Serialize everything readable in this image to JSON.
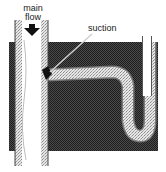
{
  "diagram": {
    "labels": {
      "main_line1": "main",
      "main_line2": "flow",
      "suction": "suction"
    },
    "colors": {
      "background": "#ffffff",
      "ground": "#3a3a3a",
      "pipe_interior": "#ffffff",
      "pipe_wall": "#9a9a9a",
      "branch_fill": "#d8d8d8",
      "ink": "#1a1a1a"
    },
    "elements": [
      {
        "name": "main-pipe",
        "description": "vertical pipe carrying main flow downward"
      },
      {
        "name": "flow-arrow",
        "description": "down arrow indicating direction of main flow"
      },
      {
        "name": "branch-pipe",
        "description": "horizontal branch pipe leaving main pipe, bending down into U-trap"
      },
      {
        "name": "u-trap",
        "description": "U-shaped bend rising to open vertical tube on right"
      },
      {
        "name": "suction-point",
        "description": "junction where suction occurs"
      },
      {
        "name": "ground-block",
        "description": "dark textured background mass"
      }
    ]
  }
}
